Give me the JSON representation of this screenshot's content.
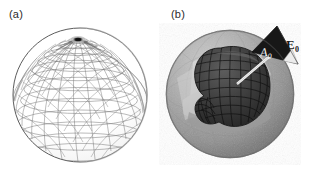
{
  "figure": {
    "background_color": "#ffffff",
    "width": 318,
    "height": 170
  },
  "panels": [
    {
      "id": "a",
      "label": "(a)",
      "caption_text": "(a)",
      "subject": "wireframe-sphere",
      "description": "Triangulated wireframe sphere mesh shown as thin gray lines on white, with mesh lines converging at a dark spot on the upper pole.",
      "colors": {
        "mesh_line": "#6e6e6e",
        "outline": "#555555",
        "pole_marker": "#1d1d1d",
        "fill": "#ffffff"
      },
      "geometry": {
        "center_x": 80,
        "center_y": 95,
        "radius": 67,
        "pole_x": 78,
        "pole_y": 38
      }
    },
    {
      "id": "b",
      "label": "(b)",
      "caption_text": "(b)",
      "subject": "cutaway-sphere-with-inner-blob",
      "description": "Shaded faceted gray sphere with a wedge cut away revealing a dark mesh blob inside; a dark triangular vector plane with a leader line points out of the sphere to the upper right.",
      "colors": {
        "outer_sphere_light": "#bcbcbc",
        "outer_sphere_mid": "#9d9d9d",
        "outer_sphere_dark": "#7b7b7b",
        "cut_face_light": "#d2d2d2",
        "cut_face_mid": "#b6b6b6",
        "inner_blob": "#3a3a3a",
        "inner_blob_mesh": "#151515",
        "inner_blob_light": "#585858",
        "vector_triangle": "#181818",
        "leader_line": "#f2f2f2"
      },
      "geometry": {
        "center_x": 71,
        "center_y": 94,
        "radius": 64
      },
      "annotations": [
        {
          "id": "a0",
          "name": "area-vector-label",
          "text": "A",
          "subscript": "0",
          "meaning": "A sub zero",
          "color": "#fafafa",
          "style": "italic"
        },
        {
          "id": "e0",
          "name": "field-vector-label",
          "text": "E",
          "subscript": "0",
          "meaning": "E sub zero",
          "color": "#1a1a1a",
          "style": "bold"
        }
      ]
    }
  ]
}
